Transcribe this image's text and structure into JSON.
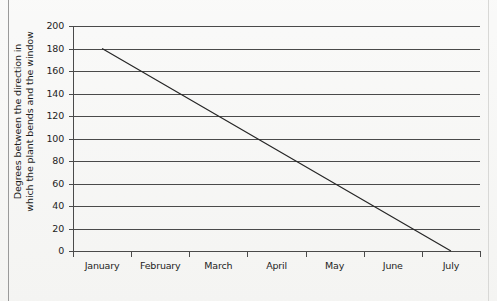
{
  "chart_data": {
    "type": "line",
    "title": "",
    "subtitle": "",
    "xlabel": "",
    "ylabel": "Degrees between the direction in which the plant bends and the window",
    "ylabel_lines": [
      "Degrees between the direction in",
      "which the plant bends and the window"
    ],
    "categories": [
      "January",
      "February",
      "March",
      "April",
      "May",
      "June",
      "July"
    ],
    "values": [
      180,
      150,
      120,
      90,
      60,
      30,
      0
    ],
    "series": [
      {
        "name": "Degrees of bend",
        "values": [
          180,
          150,
          120,
          90,
          60,
          30,
          0
        ]
      }
    ],
    "ylim": [
      0,
      200
    ],
    "yticks": [
      0,
      20,
      40,
      60,
      80,
      100,
      120,
      140,
      160,
      180,
      200
    ],
    "ytick_labels": [
      "0",
      "20",
      "40",
      "60",
      "80",
      "100",
      "120",
      "140",
      "160",
      "180",
      "200"
    ],
    "grid": true,
    "grid_axis": "y",
    "legend": false,
    "legend_position": "none",
    "line_color": "#262626",
    "grid_color": "#4a4a4a",
    "background_color": "#f3f3f1",
    "marker": "none"
  },
  "page": {
    "border_color": "#9a9a9a"
  }
}
